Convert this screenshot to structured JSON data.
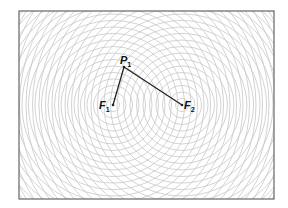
{
  "diagram": {
    "frame": {
      "x": 19,
      "y": 11,
      "width": 255,
      "height": 188,
      "stroke": "#666666"
    },
    "ring_spacing": 6.5,
    "ring_count": 30,
    "ring_color": "#c8c8c8",
    "foci": [
      {
        "id": "F1",
        "label": "F",
        "subscript": "1",
        "x": 113,
        "y": 105
      },
      {
        "id": "F2",
        "label": "F",
        "subscript": "2",
        "x": 182,
        "y": 105
      }
    ],
    "point": {
      "id": "P1",
      "label": "P",
      "subscript": "1",
      "x": 124,
      "y": 67
    },
    "segments": [
      {
        "from": "P1",
        "to": "F1"
      },
      {
        "from": "P1",
        "to": "F2"
      }
    ]
  }
}
